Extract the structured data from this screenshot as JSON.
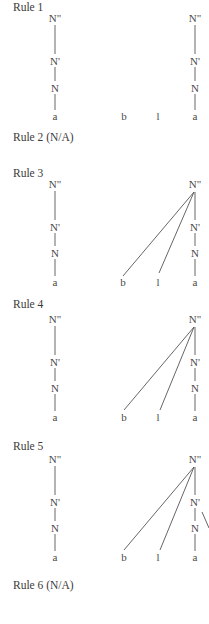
{
  "rules": [
    {
      "label": "Rule 1",
      "applicable": true,
      "attached": false
    },
    {
      "label": "Rule 2 (N/A)",
      "applicable": false
    },
    {
      "label": "Rule 3",
      "applicable": true,
      "attached": true
    },
    {
      "label": "Rule 4",
      "applicable": true,
      "attached": true
    },
    {
      "label": "Rule 5",
      "applicable": true,
      "attached": true,
      "extra_branch": true
    },
    {
      "label": "Rule 6 (N/A)",
      "applicable": false
    }
  ],
  "nodes": {
    "n_double_bar": "N\"",
    "n_bar": "N'",
    "n": "N",
    "leaf_a": "a",
    "leaf_b": "b",
    "leaf_l": "l"
  }
}
